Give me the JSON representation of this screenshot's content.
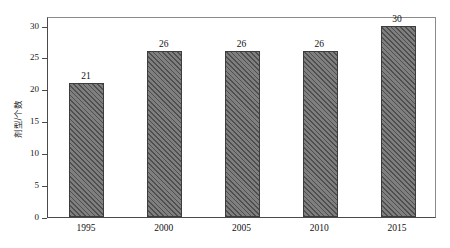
{
  "chart_data": {
    "type": "bar",
    "title": "",
    "subtitle": "",
    "xlabel": "",
    "ylabel": "剂型/个数",
    "categories": [
      "1995",
      "2000",
      "2005",
      "2010",
      "2015"
    ],
    "values": [
      21,
      26,
      26,
      26,
      30
    ],
    "value_labels": [
      "21",
      "26",
      "26",
      "26",
      "30"
    ],
    "series": [
      {
        "name": "剂型/个数",
        "values": [
          21,
          26,
          26,
          26,
          30
        ]
      }
    ],
    "ylim": [
      0,
      31.5
    ],
    "yticks": [
      0,
      5,
      10,
      15,
      20,
      25,
      30
    ],
    "ytick_labels": [
      "0",
      "5",
      "10",
      "15",
      "20",
      "25",
      "30"
    ],
    "xtick_labels": [
      "1995",
      "2000",
      "2005",
      "2010",
      "2015"
    ],
    "grid": false,
    "legend": false,
    "legend_position": "none",
    "bar_fill_color": "#7f7f7f",
    "bar_hatch_color": "#4f4f4f",
    "bar_edge_color": "#3d3d3d",
    "bar_hatch_pattern": "diagonal-45",
    "axis_color": "#4a4a4a",
    "frame_color": "#8a8a8a",
    "background_color": "#ffffff",
    "text_color": "#111111"
  }
}
